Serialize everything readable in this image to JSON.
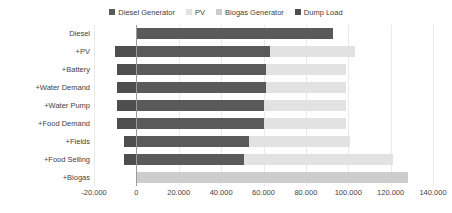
{
  "chart_data": {
    "type": "bar",
    "orientation": "horizontal",
    "stacked": true,
    "title": "",
    "subtitle": "",
    "xlabel": "",
    "ylabel": "",
    "xlim": [
      -20000,
      140000
    ],
    "xticks": [
      -20000,
      0,
      20000,
      40000,
      60000,
      80000,
      100000,
      120000,
      140000
    ],
    "xtick_labels": [
      "-20.000",
      "0",
      "20.000",
      "40.000",
      "60.000",
      "80.000",
      "100.000",
      "120.000",
      "140.000"
    ],
    "grid": true,
    "grid_axis": "x",
    "legend_position": "top-center",
    "categories": [
      "Diesel",
      "+PV",
      "+Battery",
      "+Water Demand",
      "+Water Pump",
      "+Food Demand",
      "+Fields",
      "+Food Selling",
      "+Biogas"
    ],
    "series": [
      {
        "name": "Diesel Generator",
        "color": "#5a5a5a",
        "values": [
          93000,
          63000,
          61000,
          61000,
          60000,
          60000,
          53000,
          51000,
          0
        ]
      },
      {
        "name": "PV",
        "color": "#e2e2e2",
        "values": [
          0,
          40000,
          38000,
          38000,
          39000,
          39000,
          48000,
          70000,
          0
        ]
      },
      {
        "name": "Biogas Generator",
        "color": "#cdcdcd",
        "values": [
          0,
          0,
          0,
          0,
          0,
          0,
          0,
          0,
          128000
        ]
      },
      {
        "name": "Dump Load",
        "color": "#4e4e4e",
        "values": [
          0,
          -10000,
          -9000,
          -9000,
          -9000,
          -9000,
          -6000,
          -6000,
          0
        ]
      }
    ]
  },
  "legend": {
    "entries": [
      {
        "label": "Diesel Generator",
        "color": "#5a5a5a"
      },
      {
        "label": "PV",
        "color": "#e2e2e2"
      },
      {
        "label": "Biogas Generator",
        "color": "#cdcdcd"
      },
      {
        "label": "Dump Load",
        "color": "#4e4e4e"
      }
    ]
  },
  "axes": {
    "zero_line_color": "#9b9b9b",
    "gridline_color": "#e9e9e9"
  }
}
